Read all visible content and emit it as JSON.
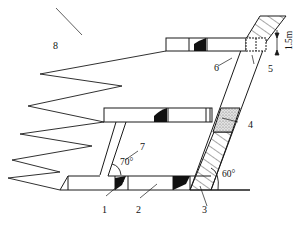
{
  "diagram": {
    "type": "mining cross-section (inclined ore body with stopes and drifts)",
    "labels": {
      "l1": "1",
      "l2": "2",
      "l3": "3",
      "l4": "4",
      "l5": "5",
      "l6": "6",
      "l7": "7",
      "l8": "8"
    },
    "dimension": "1.5m",
    "angles": {
      "raise": "70°",
      "orebody": "60°"
    },
    "colors": {
      "line": "#1a1a1a",
      "fill_dark": "#111111",
      "stipple": "#bdbdbd",
      "background": "#ffffff"
    }
  }
}
